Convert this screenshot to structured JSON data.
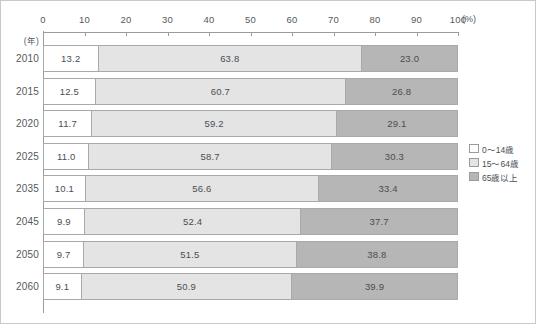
{
  "chart_data": {
    "type": "bar",
    "orientation": "horizontal",
    "stacked": true,
    "title": "",
    "xlabel": "(%)",
    "ylabel": "(年)",
    "xlim": [
      0,
      100
    ],
    "xticks": [
      0,
      10,
      20,
      30,
      40,
      50,
      60,
      70,
      80,
      90,
      100
    ],
    "xtick_labels": [
      "0",
      "10",
      "20",
      "30",
      "40",
      "50",
      "60",
      "70",
      "80",
      "90",
      "100"
    ],
    "unit_suffix": "(%)",
    "grid": false,
    "legend_position": "right",
    "categories": [
      "2010",
      "2015",
      "2020",
      "2025",
      "2035",
      "2045",
      "2050",
      "2060"
    ],
    "series": [
      {
        "name": "0〜14歳",
        "color": "#ffffff",
        "values": [
          13.2,
          12.5,
          11.7,
          11.0,
          10.1,
          9.9,
          9.7,
          9.1
        ],
        "labels": [
          "13.2",
          "12.5",
          "11.7",
          "11.0",
          "10.1",
          "9.9",
          "9.7",
          "9.1"
        ]
      },
      {
        "name": "15〜64歳",
        "color": "#e4e4e4",
        "values": [
          63.8,
          60.7,
          59.2,
          58.7,
          56.6,
          52.4,
          51.5,
          50.9
        ],
        "labels": [
          "63.8",
          "60.7",
          "59.2",
          "58.7",
          "56.6",
          "52.4",
          "51.5",
          "50.9"
        ]
      },
      {
        "name": "65歳以上",
        "color": "#b6b6b6",
        "values": [
          23.0,
          26.8,
          29.1,
          30.3,
          33.4,
          37.7,
          38.8,
          39.9
        ],
        "labels": [
          "23.0",
          "26.8",
          "29.1",
          "30.3",
          "33.4",
          "37.7",
          "38.8",
          "39.9"
        ]
      }
    ]
  },
  "axis": {
    "unit_label": "(年)",
    "percent_label": "(%)",
    "ticks": [
      "0",
      "10",
      "20",
      "30",
      "40",
      "50",
      "60",
      "70",
      "80",
      "90",
      "100"
    ]
  },
  "legend": {
    "items": [
      {
        "label": "0〜14歳",
        "color": "#ffffff"
      },
      {
        "label": "15〜64歳",
        "color": "#e4e4e4"
      },
      {
        "label": "65歳以上",
        "color": "#b6b6b6"
      }
    ]
  },
  "rows": [
    {
      "year": "2010",
      "young": "13.2",
      "working": "63.8",
      "old": "23.0"
    },
    {
      "year": "2015",
      "young": "12.5",
      "working": "60.7",
      "old": "26.8"
    },
    {
      "year": "2020",
      "young": "11.7",
      "working": "59.2",
      "old": "29.1"
    },
    {
      "year": "2025",
      "young": "11.0",
      "working": "58.7",
      "old": "30.3"
    },
    {
      "year": "2035",
      "young": "10.1",
      "working": "56.6",
      "old": "33.4"
    },
    {
      "year": "2045",
      "young": "9.9",
      "working": "52.4",
      "old": "37.7"
    },
    {
      "year": "2050",
      "young": "9.7",
      "working": "51.5",
      "old": "38.8"
    },
    {
      "year": "2060",
      "young": "9.1",
      "working": "50.9",
      "old": "39.9"
    }
  ],
  "colors": {
    "young": "#ffffff",
    "working": "#e4e4e4",
    "old": "#b6b6b6",
    "border": "#a9a9a9",
    "axis": "#9b9b9b",
    "text": "#55595c",
    "frame": "#c9c9c9"
  }
}
